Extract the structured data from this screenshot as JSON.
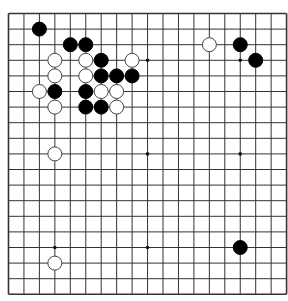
{
  "board": {
    "size": 19,
    "origin_x": 8.5,
    "origin_y": 13.5,
    "spacing_x": 15.45,
    "spacing_y": 15.6,
    "line_color": "#333333",
    "background": "#ffffff",
    "star_points": [
      [
        3,
        3
      ],
      [
        9,
        3
      ],
      [
        15,
        3
      ],
      [
        3,
        9
      ],
      [
        9,
        9
      ],
      [
        15,
        9
      ],
      [
        3,
        15
      ],
      [
        9,
        15
      ],
      [
        15,
        15
      ]
    ],
    "stones": [
      {
        "color": "black",
        "col": 2,
        "row": 1
      },
      {
        "color": "black",
        "col": 4,
        "row": 2
      },
      {
        "color": "black",
        "col": 5,
        "row": 2
      },
      {
        "color": "white",
        "col": 13,
        "row": 2
      },
      {
        "color": "black",
        "col": 15,
        "row": 2
      },
      {
        "color": "white",
        "col": 3,
        "row": 3
      },
      {
        "color": "white",
        "col": 5,
        "row": 3
      },
      {
        "color": "black",
        "col": 6,
        "row": 3
      },
      {
        "color": "white",
        "col": 8,
        "row": 3
      },
      {
        "color": "black",
        "col": 16,
        "row": 3
      },
      {
        "color": "white",
        "col": 3,
        "row": 4
      },
      {
        "color": "white",
        "col": 5,
        "row": 4
      },
      {
        "color": "black",
        "col": 6,
        "row": 4
      },
      {
        "color": "black",
        "col": 7,
        "row": 4
      },
      {
        "color": "black",
        "col": 8,
        "row": 4
      },
      {
        "color": "white",
        "col": 2,
        "row": 5
      },
      {
        "color": "black",
        "col": 3,
        "row": 5
      },
      {
        "color": "black",
        "col": 5,
        "row": 5
      },
      {
        "color": "white",
        "col": 6,
        "row": 5
      },
      {
        "color": "white",
        "col": 7,
        "row": 5
      },
      {
        "color": "white",
        "col": 3,
        "row": 6
      },
      {
        "color": "black",
        "col": 5,
        "row": 6
      },
      {
        "color": "black",
        "col": 6,
        "row": 6
      },
      {
        "color": "white",
        "col": 7,
        "row": 6
      },
      {
        "color": "white",
        "col": 3,
        "row": 9
      },
      {
        "color": "black",
        "col": 15,
        "row": 15
      },
      {
        "color": "white",
        "col": 3,
        "row": 16
      }
    ]
  }
}
